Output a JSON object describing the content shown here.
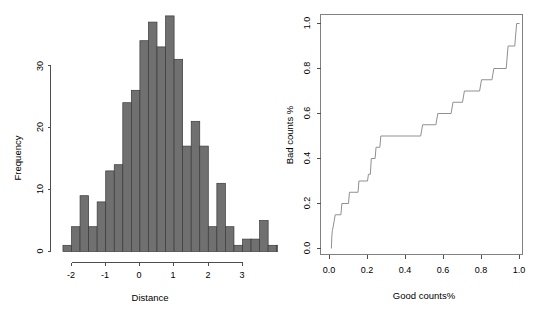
{
  "figure": {
    "panels": [
      "histogram-distance",
      "roc-good-bad"
    ]
  },
  "left_panel": {
    "xlabel": "Distance",
    "ylabel": "Frequency",
    "x_ticks": [
      "-2",
      "-1",
      "0",
      "1",
      "2",
      "3"
    ],
    "y_ticks": [
      "0",
      "10",
      "20",
      "30"
    ]
  },
  "right_panel": {
    "xlabel": "Good counts%",
    "ylabel": "Bad counts %",
    "x_ticks": [
      "0.0",
      "0.2",
      "0.4",
      "0.6",
      "0.8",
      "1.0"
    ],
    "y_ticks": [
      "0.0",
      "0.2",
      "0.4",
      "0.6",
      "0.8",
      "1.0"
    ]
  },
  "colors": {
    "bar_fill": "#707070",
    "bar_border": "#3a3a3a",
    "axis": "#4d4d4d",
    "frame": "#808080",
    "curve": "#909090",
    "background": "#ffffff"
  },
  "chart_data": [
    {
      "type": "bar",
      "name": "histogram-distance",
      "title": "",
      "xlabel": "Distance",
      "ylabel": "Frequency",
      "xlim": [
        -2.25,
        3.5
      ],
      "ylim": [
        0,
        38
      ],
      "grid": false,
      "legend": null,
      "bin_width": 0.25,
      "bin_starts": [
        -2.25,
        -2.0,
        -1.75,
        -1.5,
        -1.25,
        -1.0,
        -0.75,
        -0.5,
        -0.25,
        0.0,
        0.25,
        0.5,
        0.75,
        1.0,
        1.25,
        1.5,
        1.75,
        2.0,
        2.25,
        2.5,
        2.75,
        3.0,
        3.25
      ],
      "categories": [
        "-2.25",
        "-2.00",
        "-1.75",
        "-1.50",
        "-1.25",
        "-1.00",
        "-0.75",
        "-0.50",
        "-0.25",
        "0.00",
        "0.25",
        "0.50",
        "0.75",
        "1.00",
        "1.25",
        "1.50",
        "1.75",
        "2.00",
        "2.25",
        "2.50",
        "2.75",
        "3.00",
        "3.25"
      ],
      "values": [
        1,
        4,
        9,
        4,
        8,
        13,
        14,
        24,
        26,
        34,
        37,
        33,
        38,
        31,
        17,
        21,
        17,
        4,
        11,
        4,
        1,
        2,
        2,
        5,
        1,
        1
      ],
      "x_ticks": [
        -2,
        -1,
        0,
        1,
        2,
        3
      ],
      "y_ticks": [
        0,
        10,
        20,
        30
      ]
    },
    {
      "type": "line",
      "name": "roc-good-bad",
      "title": "",
      "xlabel": "Good counts%",
      "ylabel": "Bad counts %",
      "xlim": [
        0.0,
        1.0
      ],
      "ylim": [
        0.0,
        1.0
      ],
      "grid": false,
      "legend": null,
      "step": true,
      "x_ticks": [
        0.0,
        0.2,
        0.4,
        0.6,
        0.8,
        1.0
      ],
      "y_ticks": [
        0.0,
        0.2,
        0.4,
        0.6,
        0.8,
        1.0
      ],
      "x": [
        0.01,
        0.012,
        0.015,
        0.02,
        0.03,
        0.06,
        0.065,
        0.1,
        0.105,
        0.15,
        0.155,
        0.2,
        0.205,
        0.215,
        0.22,
        0.24,
        0.245,
        0.265,
        0.27,
        0.48,
        0.49,
        0.56,
        0.57,
        0.64,
        0.65,
        0.7,
        0.71,
        0.79,
        0.8,
        0.855,
        0.865,
        0.93,
        0.94,
        0.975,
        0.985,
        1.0
      ],
      "y": [
        0.0,
        0.05,
        0.08,
        0.1,
        0.15,
        0.15,
        0.2,
        0.2,
        0.25,
        0.25,
        0.3,
        0.3,
        0.33,
        0.33,
        0.4,
        0.4,
        0.45,
        0.45,
        0.5,
        0.5,
        0.55,
        0.55,
        0.6,
        0.6,
        0.65,
        0.65,
        0.7,
        0.7,
        0.75,
        0.75,
        0.8,
        0.8,
        0.9,
        0.9,
        1.0,
        1.0
      ]
    }
  ]
}
